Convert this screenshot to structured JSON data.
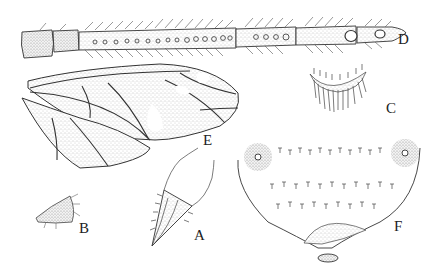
{
  "figure": {
    "type": "scientific-illustration-plate",
    "ink_color": "#2a2a2a",
    "stipple_color": "#9a9a9a",
    "background": "#ffffff",
    "panels": [
      {
        "id": "D",
        "label": "D",
        "description": "antenna",
        "label_pos": [
          398,
          40
        ]
      },
      {
        "id": "E",
        "label": "E",
        "description": "fore and hind wings",
        "label_pos": [
          207,
          72
        ]
      },
      {
        "id": "C",
        "label": "C",
        "description": "bristled lobe",
        "label_pos": [
          386,
          102
        ]
      },
      {
        "id": "B",
        "label": "B",
        "description": "small segment",
        "label_pos": [
          79,
          229
        ]
      },
      {
        "id": "A",
        "label": "A",
        "description": "terminal segment with appendage",
        "label_pos": [
          194,
          236
        ]
      },
      {
        "id": "F",
        "label": "F",
        "description": "setose plate with sensory pores",
        "label_pos": [
          394,
          227
        ]
      }
    ]
  }
}
